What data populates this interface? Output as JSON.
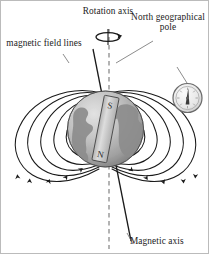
{
  "figure": {
    "background_color": "#ffffff",
    "width": 209,
    "height": 254
  },
  "labels": {
    "magnetic_field_lines": "magnetic field lines",
    "rotation_axis": "Rotation axis",
    "north_geographical_pole": "North geographical pole",
    "magnetic_axis": "Magnetic axis"
  },
  "magnet": {
    "south_pole_letter": "S",
    "north_pole_letter": "N"
  },
  "colors": {
    "line": "#1a1a1a",
    "globe_light": "#d8d8d8",
    "globe_dark": "#8e8e8e",
    "globe_outline": "#555555",
    "continent": "#9a9a9a",
    "magnet_body": "#c9c9c9",
    "dashed_axis": "#9a9a9a",
    "compass_face": "#ededed"
  },
  "icons": {
    "rotation_arrow": "rotation-arrow-icon",
    "compass": "compass-icon",
    "bar_magnet": "bar-magnet-icon",
    "globe": "globe-icon"
  }
}
